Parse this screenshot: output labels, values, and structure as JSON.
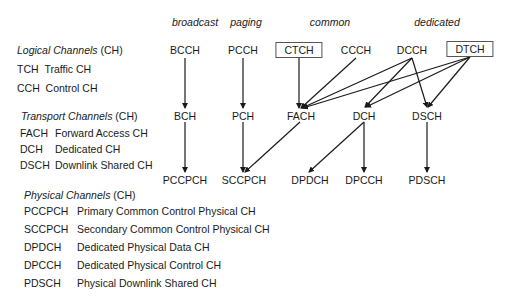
{
  "columns": {
    "broadcast": "broadcast",
    "paging": "paging",
    "common": "common",
    "dedicated": "dedicated"
  },
  "logical": {
    "title_italic": "Logical Channels",
    "title_suffix": " (CH)",
    "legend": [
      {
        "abbr": "TCH",
        "desc": "Traffic CH"
      },
      {
        "abbr": "CCH",
        "desc": "Control CH"
      }
    ],
    "nodes": {
      "bcch": "BCCH",
      "pcch": "PCCH",
      "ctch": "CTCH",
      "ccch": "CCCH",
      "dcch": "DCCH",
      "dtch": "DTCH"
    }
  },
  "transport": {
    "title_italic": "Transport Channels",
    "title_suffix": " (CH)",
    "legend": [
      {
        "abbr": "FACH",
        "desc": "Forward Access CH"
      },
      {
        "abbr": "DCH",
        "desc": "Dedicated CH"
      },
      {
        "abbr": "DSCH",
        "desc": "Downlink Shared CH"
      }
    ],
    "nodes": {
      "bch": "BCH",
      "pch": "PCH",
      "fach": "FACH",
      "dch": "DCH",
      "dsch": "DSCH"
    }
  },
  "physical": {
    "title_italic": "Physical Channels",
    "title_suffix": " (CH)",
    "legend": [
      {
        "abbr": "PCCPCH",
        "desc": "Primary Common Control Physical CH"
      },
      {
        "abbr": "SCCPCH",
        "desc": "Secondary Common Control Physical CH"
      },
      {
        "abbr": "DPDCH",
        "desc": "Dedicated Physical Data CH"
      },
      {
        "abbr": "DPCCH",
        "desc": "Dedicated Physical Control CH"
      },
      {
        "abbr": "PDSCH",
        "desc": "Physical Downlink Shared CH"
      }
    ],
    "nodes": {
      "pccpch": "PCCPCH",
      "sccpch": "SCCPCH",
      "dpdch": "DPDCH",
      "dpcch": "DPCCH",
      "pdsch": "PDSCH"
    }
  },
  "mappings": [
    {
      "from": "BCCH",
      "to": "BCH"
    },
    {
      "from": "PCCH",
      "to": "PCH"
    },
    {
      "from": "CTCH",
      "to": "FACH"
    },
    {
      "from": "CCCH",
      "to": "FACH"
    },
    {
      "from": "DCCH",
      "to": "FACH"
    },
    {
      "from": "DCCH",
      "to": "DCH"
    },
    {
      "from": "DCCH",
      "to": "DSCH"
    },
    {
      "from": "DTCH",
      "to": "FACH"
    },
    {
      "from": "DTCH",
      "to": "DCH"
    },
    {
      "from": "DTCH",
      "to": "DSCH"
    },
    {
      "from": "BCH",
      "to": "PCCPCH"
    },
    {
      "from": "PCH",
      "to": "SCCPCH"
    },
    {
      "from": "FACH",
      "to": "SCCPCH"
    },
    {
      "from": "DCH",
      "to": "DPDCH"
    },
    {
      "from": "DCH",
      "to": "DPCCH"
    },
    {
      "from": "DSCH",
      "to": "PDSCH"
    }
  ],
  "colors": {
    "line": "#1a1a1a",
    "box_border": "#555555"
  }
}
